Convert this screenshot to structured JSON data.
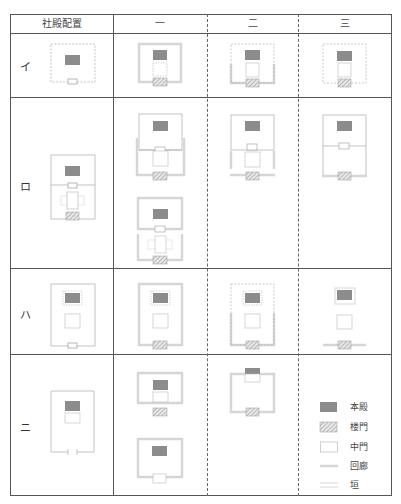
{
  "table": {
    "header": {
      "layout_label": "社殿配置",
      "columns": [
        "一",
        "二",
        "三"
      ]
    },
    "rows": [
      {
        "label": "イ"
      },
      {
        "label": "ロ"
      },
      {
        "label": "ハ"
      },
      {
        "label": "ニ"
      }
    ]
  },
  "legend": {
    "items": [
      {
        "label": "本殿",
        "symbol": "filled-gray-rect"
      },
      {
        "label": "楼門",
        "symbol": "hatched-rect"
      },
      {
        "label": "中門",
        "symbol": "outline-rect"
      },
      {
        "label": "回廊",
        "symbol": "thick-light-line"
      },
      {
        "label": "垣",
        "symbol": "thin-line"
      }
    ]
  },
  "colors": {
    "honden": "#8c8c8c",
    "kairo": "#d6d6d6",
    "kaki": "#9a9a9a",
    "border": "#555555"
  }
}
